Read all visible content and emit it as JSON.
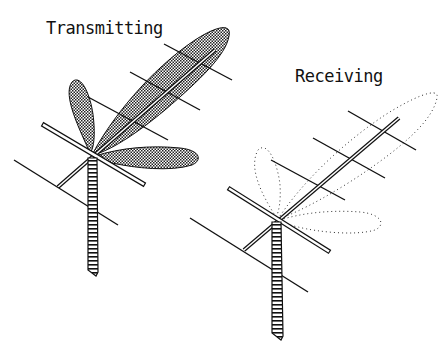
{
  "diagram": {
    "panels": [
      {
        "id": "transmitting",
        "label": "Transmitting",
        "pattern_style": "solid stippled lobes"
      },
      {
        "id": "receiving",
        "label": "Receiving",
        "pattern_style": "dotted outline lobes"
      }
    ],
    "colors": {
      "ink": "#111111",
      "background": "#ffffff",
      "stipple": "#222222"
    }
  }
}
